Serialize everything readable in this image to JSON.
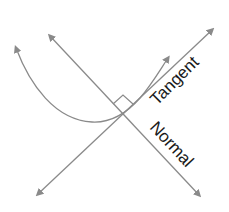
{
  "diagram": {
    "labels": {
      "tangent": "Tangent",
      "normal": "Normal"
    },
    "colors": {
      "line": "#8a8a8a",
      "arrowhead": "#8a8a8a",
      "text": "#1a1a1a",
      "background": "#ffffff"
    },
    "elements": [
      {
        "id": "curve",
        "type": "curve-with-arrows"
      },
      {
        "id": "tangent-line",
        "type": "double-arrow-line"
      },
      {
        "id": "normal-line",
        "type": "double-arrow-line"
      },
      {
        "id": "right-angle-marker",
        "type": "marker"
      }
    ]
  }
}
